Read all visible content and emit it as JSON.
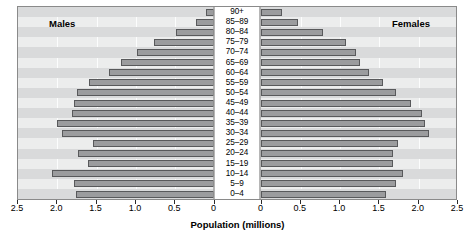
{
  "labels": {
    "males": "Males",
    "females": "Females",
    "axis_title": "Population (millions)"
  },
  "axis": {
    "left_ticks": [
      "2.5",
      "2.0",
      "1.5",
      "1.0",
      "0.5",
      "0"
    ],
    "right_ticks": [
      "0",
      "0.5",
      "1.0",
      "1.5",
      "2.0",
      "2.5"
    ]
  },
  "chart_data": {
    "type": "bar",
    "subtype": "population-pyramid",
    "title": "",
    "xlabel": "Population (millions)",
    "ylabel": "",
    "xlim": [
      0,
      2.5
    ],
    "grid": true,
    "legend": [
      "Males",
      "Females"
    ],
    "legend_position": "inside-top-corners",
    "orientation": "horizontal",
    "categories": [
      "90+",
      "85–89",
      "80–84",
      "75–79",
      "70–74",
      "65–69",
      "60–64",
      "55–59",
      "50–54",
      "45–49",
      "40–44",
      "35–39",
      "30–34",
      "25–29",
      "20–24",
      "15–19",
      "10–14",
      "5–9",
      "0–4"
    ],
    "series": [
      {
        "name": "Males",
        "direction": "left",
        "values": [
          0.1,
          0.22,
          0.48,
          0.76,
          0.97,
          1.18,
          1.33,
          1.58,
          1.74,
          1.77,
          1.8,
          1.99,
          1.93,
          1.53,
          1.72,
          1.6,
          2.05,
          1.77,
          1.75
        ]
      },
      {
        "name": "Females",
        "direction": "right",
        "values": [
          0.27,
          0.48,
          0.8,
          1.09,
          1.21,
          1.27,
          1.38,
          1.56,
          1.73,
          1.92,
          2.05,
          2.09,
          2.14,
          1.75,
          1.68,
          1.68,
          1.81,
          1.72,
          1.6
        ]
      }
    ]
  },
  "style": {
    "bar_fill": "#9b9c9e",
    "bar_stroke": "#58595b",
    "panel_bg": "#eceded",
    "band_bg": "#d9dadb",
    "center_bg": "#ffffff"
  }
}
